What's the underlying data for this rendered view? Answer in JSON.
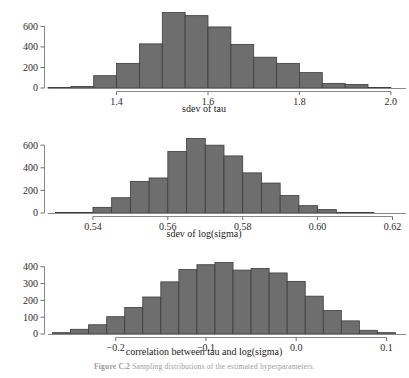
{
  "figure": {
    "caption_number": "Figure C.2",
    "caption_text": "Sampling distributions of the estimated hyperparameters.",
    "background_color": "#ffffff",
    "bar_fill_color": "#6e6e6e",
    "bar_stroke_color": "#3d3d3d",
    "axis_color": "#8a8a8a"
  },
  "chart_data": [
    {
      "type": "bar",
      "id": "sdev-of-tau",
      "title": "",
      "xlabel": "sdev of tau",
      "ylabel": "",
      "xlim": [
        1.25,
        2.02
      ],
      "ylim": [
        0,
        760
      ],
      "xticks": [
        "1.4",
        "1.6",
        "1.8",
        "2.0"
      ],
      "xtickvalues": [
        1.4,
        1.6,
        1.8,
        2.0
      ],
      "yticks": [
        "0",
        "200",
        "400",
        "600"
      ],
      "ytickvalues": [
        0,
        200,
        400,
        600
      ],
      "grid": false,
      "legend": null,
      "bin_edges": [
        1.25,
        1.3,
        1.35,
        1.4,
        1.45,
        1.5,
        1.55,
        1.6,
        1.65,
        1.7,
        1.75,
        1.8,
        1.85,
        1.9,
        1.95,
        2.0
      ],
      "bin_labels": [
        "1.25-1.30",
        "1.30-1.35",
        "1.35-1.40",
        "1.40-1.45",
        "1.45-1.50",
        "1.50-1.55",
        "1.55-1.60",
        "1.60-1.65",
        "1.65-1.70",
        "1.70-1.75",
        "1.75-1.80",
        "1.80-1.85",
        "1.85-1.90",
        "1.90-1.95",
        "1.95-2.00"
      ],
      "values": [
        5,
        15,
        120,
        240,
        430,
        735,
        705,
        595,
        425,
        300,
        240,
        150,
        45,
        35,
        5
      ]
    },
    {
      "type": "bar",
      "id": "sdev-of-log-sigma",
      "title": "",
      "xlabel": "sdev of log(sigma)",
      "ylabel": "",
      "xlim": [
        0.528,
        0.622
      ],
      "ylim": [
        0,
        690
      ],
      "xticks": [
        "0.54",
        "0.56",
        "0.58",
        "0.60",
        "0.62"
      ],
      "xtickvalues": [
        0.54,
        0.56,
        0.58,
        0.6,
        0.62
      ],
      "yticks": [
        "0",
        "200",
        "400",
        "600"
      ],
      "ytickvalues": [
        0,
        200,
        400,
        600
      ],
      "grid": false,
      "legend": null,
      "bin_edges": [
        0.53,
        0.535,
        0.54,
        0.545,
        0.55,
        0.555,
        0.56,
        0.565,
        0.57,
        0.575,
        0.58,
        0.585,
        0.59,
        0.595,
        0.6,
        0.605,
        0.61,
        0.615
      ],
      "bin_labels": [
        "0.530-0.535",
        "0.535-0.540",
        "0.540-0.545",
        "0.545-0.550",
        "0.550-0.555",
        "0.555-0.560",
        "0.560-0.565",
        "0.565-0.570",
        "0.570-0.575",
        "0.575-0.580",
        "0.580-0.585",
        "0.585-0.590",
        "0.590-0.595",
        "0.595-0.600",
        "0.600-0.605",
        "0.605-0.610",
        "0.610-0.615"
      ],
      "values": [
        2,
        5,
        50,
        135,
        280,
        310,
        545,
        660,
        600,
        505,
        355,
        265,
        155,
        65,
        30,
        5,
        2
      ]
    },
    {
      "type": "bar",
      "id": "correlation-tau-log-sigma",
      "title": "",
      "xlabel": "correlation between tau and log(sigma)",
      "ylabel": "",
      "xlim": [
        -0.275,
        0.115
      ],
      "ylim": [
        0,
        440
      ],
      "xticks": [
        "-0.2",
        "-0.1",
        "0.0",
        "0.1"
      ],
      "xtickvalues": [
        -0.2,
        -0.1,
        0.0,
        0.1
      ],
      "yticks": [
        "0",
        "100",
        "200",
        "300",
        "400"
      ],
      "ytickvalues": [
        0,
        100,
        200,
        300,
        400
      ],
      "grid": false,
      "legend": null,
      "bin_edges": [
        -0.27,
        -0.25,
        -0.23,
        -0.21,
        -0.19,
        -0.17,
        -0.15,
        -0.13,
        -0.11,
        -0.09,
        -0.07,
        -0.05,
        -0.03,
        -0.01,
        0.01,
        0.03,
        0.05,
        0.07,
        0.09,
        0.11
      ],
      "bin_labels": [
        "-0.27--0.25",
        "-0.25--0.23",
        "-0.23--0.21",
        "-0.21--0.19",
        "-0.19--0.17",
        "-0.17--0.15",
        "-0.15--0.13",
        "-0.13--0.11",
        "-0.11--0.09",
        "-0.09--0.07",
        "-0.07--0.05",
        "-0.05--0.03",
        "-0.03--0.01",
        "-0.01-0.01",
        "0.01-0.03",
        "0.03-0.05",
        "0.05-0.07",
        "0.07-0.09",
        "0.09-0.11"
      ],
      "values": [
        8,
        28,
        55,
        103,
        158,
        220,
        310,
        383,
        412,
        425,
        380,
        390,
        363,
        313,
        225,
        140,
        78,
        22,
        8
      ]
    }
  ]
}
